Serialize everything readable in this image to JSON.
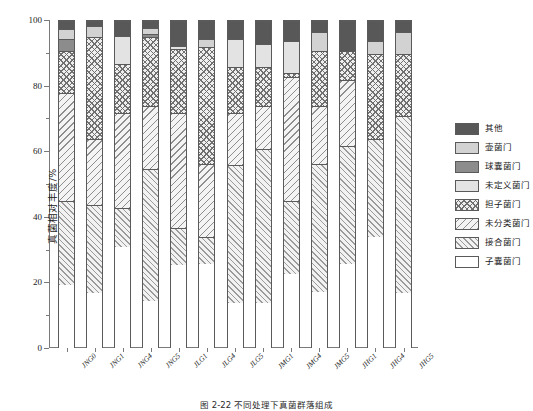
{
  "figure": {
    "caption": "图 2-22  不同处理下真菌群落组成"
  },
  "chart_data": {
    "type": "bar",
    "stacked": true,
    "title": "",
    "xlabel": "",
    "ylabel": "真菌相对丰度/%",
    "ylim": [
      0,
      100
    ],
    "yticks": [
      0,
      20,
      40,
      60,
      80,
      100
    ],
    "ytick_labels": [
      "0",
      "20",
      "40",
      "60",
      "80",
      "100"
    ],
    "grid": false,
    "legend_position": "right",
    "categories": [
      "JNG0",
      "JNG1",
      "JNG4",
      "JNG5",
      "JLG1",
      "JLG4",
      "JLG5",
      "JMG1",
      "JMG4",
      "JMG5",
      "JHG1",
      "JHG4",
      "JHG5"
    ],
    "series": [
      {
        "name": "子囊菌门",
        "key": "ascomycota",
        "fill": "solid-white",
        "values": [
          19.5,
          17.0,
          31.0,
          14.5,
          25.5,
          26.0,
          14.0,
          14.0,
          23.0,
          17.5,
          26.0,
          34.0,
          17.0
        ]
      },
      {
        "name": "接合菌门",
        "key": "zygomycota",
        "fill": "diagonal-up-hatch",
        "values": [
          25.5,
          27.0,
          12.0,
          40.5,
          11.5,
          8.0,
          42.0,
          47.0,
          22.0,
          39.0,
          36.0,
          30.0,
          54.0
        ]
      },
      {
        "name": "未分类菌门",
        "key": "unclassified",
        "fill": "diagonal-down-hatch",
        "values": [
          33.0,
          20.0,
          29.0,
          19.0,
          35.0,
          22.5,
          16.0,
          13.0,
          38.0,
          17.5,
          20.0,
          0.0,
          0.0
        ]
      },
      {
        "name": "担子菌门",
        "key": "basidiomycota",
        "fill": "cross-hatch",
        "values": [
          13.0,
          31.0,
          15.0,
          21.0,
          19.5,
          35.5,
          14.0,
          12.0,
          1.0,
          17.0,
          9.0,
          26.0,
          19.0
        ]
      },
      {
        "name": "未定义菌门",
        "key": "undefined",
        "fill": "light-gray",
        "values": [
          0.0,
          0.0,
          8.5,
          0.0,
          1.0,
          0.0,
          8.5,
          7.0,
          10.0,
          0.0,
          0.0,
          0.0,
          0.0
        ]
      },
      {
        "name": "球囊菌门",
        "key": "blastocladiomycota",
        "fill": "dark-gray",
        "values": [
          3.5,
          0.0,
          0.0,
          1.0,
          0.0,
          0.0,
          0.0,
          0.0,
          0.0,
          0.0,
          0.0,
          0.0,
          0.0
        ]
      },
      {
        "name": "壶菌门",
        "key": "chytridiomycota",
        "fill": "mid-light-gray",
        "values": [
          3.0,
          3.5,
          0.0,
          2.0,
          0.0,
          2.5,
          0.0,
          0.0,
          0.0,
          5.5,
          0.0,
          4.0,
          6.5
        ]
      },
      {
        "name": "其他",
        "key": "other",
        "fill": "darkest-gray",
        "values": [
          2.5,
          1.5,
          4.5,
          2.0,
          7.5,
          5.5,
          5.5,
          7.0,
          6.0,
          3.5,
          9.0,
          6.0,
          3.5
        ]
      }
    ]
  },
  "legend": {
    "items": [
      {
        "label": "其他",
        "key": "other"
      },
      {
        "label": "壶菌门",
        "key": "chytridiomycota"
      },
      {
        "label": "球囊菌门",
        "key": "blastocladiomycota"
      },
      {
        "label": "未定义菌门",
        "key": "undefined"
      },
      {
        "label": "担子菌门",
        "key": "basidiomycota"
      },
      {
        "label": "未分类菌门",
        "key": "unclassified"
      },
      {
        "label": "接合菌门",
        "key": "zygomycota"
      },
      {
        "label": "子囊菌门",
        "key": "ascomycota"
      }
    ]
  },
  "colors": {
    "other": "#585858",
    "chytridiomycota": "#d2d2d2",
    "blastocladiomycota": "#8c8c8c",
    "undefined": "#e3e3e3",
    "axis": "#7a7a7a",
    "outline": "#5a5a5a"
  }
}
